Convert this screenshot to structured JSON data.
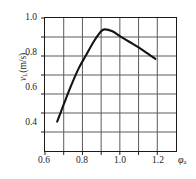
{
  "chart_data": {
    "type": "line",
    "title": "",
    "subtitle": "",
    "xlabel": "φa",
    "xlabel_base": "φ",
    "xlabel_sub": "a",
    "ylabel": "vL(m/s)",
    "ylabel_base": "v",
    "ylabel_sub": "L",
    "ylabel_unit": "(m/s)",
    "xlim": [
      0.6,
      1.3
    ],
    "ylim": [
      0.3,
      1.0
    ],
    "xticks": [
      0.6,
      0.7,
      0.8,
      0.9,
      1.0,
      1.1,
      1.2
    ],
    "xtick_labels": [
      "0.6",
      "",
      "0.8",
      "",
      "1.0",
      "",
      "1.2"
    ],
    "yticks": [
      0.4,
      0.5,
      0.6,
      0.7,
      0.8,
      0.9,
      1.0
    ],
    "ytick_labels": [
      "0.4",
      "",
      "0.6",
      "",
      "0.8",
      "",
      "1.0"
    ],
    "grid": true,
    "grid_color": "#5a5a5a",
    "frame_color": "#1a1a1a",
    "legend": null,
    "legend_position": "none",
    "series": [
      {
        "name": "laminar burning velocity",
        "color": "#141414",
        "line_width": 2.1,
        "x": [
          0.665,
          0.7,
          0.74,
          0.78,
          0.82,
          0.86,
          0.9,
          0.92,
          0.96,
          1.0,
          1.05,
          1.1,
          1.15,
          1.19
        ],
        "values": [
          0.455,
          0.545,
          0.645,
          0.735,
          0.805,
          0.875,
          0.93,
          0.94,
          0.93,
          0.905,
          0.875,
          0.845,
          0.812,
          0.785
        ]
      }
    ]
  },
  "axis": {
    "y_ticks_display": [
      {
        "label": "1.0",
        "value": 1.0
      },
      {
        "label": "0.8",
        "value": 0.8
      },
      {
        "label": "0.6",
        "value": 0.6
      },
      {
        "label": "0.4",
        "value": 0.4
      }
    ],
    "x_ticks_display": [
      {
        "label": "0.6",
        "value": 0.6
      },
      {
        "label": "0.8",
        "value": 0.8
      },
      {
        "label": "1.0",
        "value": 1.0
      },
      {
        "label": "1.2",
        "value": 1.2
      }
    ]
  }
}
